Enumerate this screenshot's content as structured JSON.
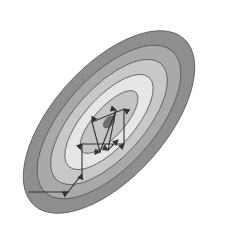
{
  "diagram": {
    "type": "contour-plot-with-optimization-path",
    "background": "#ffffff",
    "center": [
      109,
      122
    ],
    "rotation_deg": -48,
    "contours": [
      {
        "level": 1,
        "rx": 112,
        "ry": 56,
        "fill": "#8e8e8e"
      },
      {
        "level": 2,
        "rx": 95,
        "ry": 45,
        "fill": "#a9a9a9"
      },
      {
        "level": 3,
        "rx": 78,
        "ry": 35,
        "fill": "#c8c8c8"
      },
      {
        "level": 4,
        "rx": 60,
        "ry": 25,
        "fill": "#e6e6e6"
      },
      {
        "level": 5,
        "rx": 40,
        "ry": 15,
        "fill": "#c4c4c4"
      },
      {
        "level": 6,
        "rx": 7,
        "ry": 4,
        "fill": "#6e6e6e"
      }
    ],
    "stroke": "#555555",
    "arrow_color": "#333333",
    "path_points": [
      [
        28,
        192
      ],
      [
        68,
        192
      ],
      [
        82,
        174
      ],
      [
        82,
        144
      ],
      [
        124,
        144
      ],
      [
        124,
        109
      ],
      [
        92,
        122
      ],
      [
        100,
        152
      ],
      [
        116,
        110
      ],
      [
        108,
        150
      ],
      [
        118,
        140
      ]
    ]
  }
}
